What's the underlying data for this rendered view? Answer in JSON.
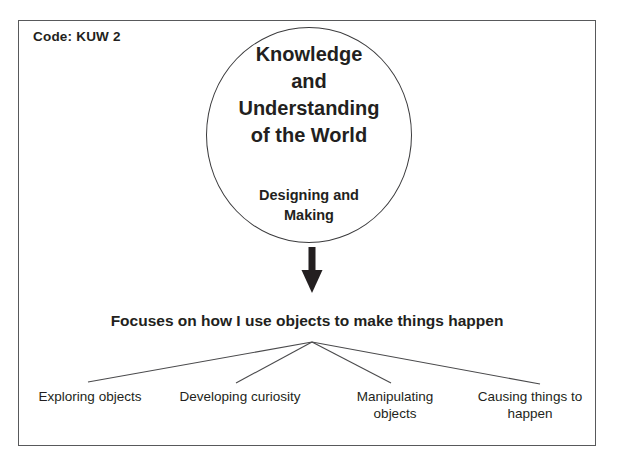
{
  "diagram": {
    "code_label": "Code: KUW 2",
    "circle": {
      "title_lines": [
        "Knowledge",
        "and",
        "Understanding",
        "of the World"
      ],
      "subtitle_lines": [
        "Designing and",
        "Making"
      ]
    },
    "statement": "Focuses on how I use objects to make things happen",
    "branches": [
      {
        "lines": [
          "Exploring objects"
        ]
      },
      {
        "lines": [
          "Developing curiosity"
        ]
      },
      {
        "lines": [
          "Manipulating",
          "objects"
        ]
      },
      {
        "lines": [
          "Causing things to",
          "happen"
        ]
      }
    ],
    "colors": {
      "frame_stroke": "#58595b",
      "circle_stroke": "#3b3b3d",
      "arrow_fill": "#231f20",
      "line_stroke": "#4a4a4c",
      "text": "#231f20",
      "background": "#ffffff"
    }
  }
}
